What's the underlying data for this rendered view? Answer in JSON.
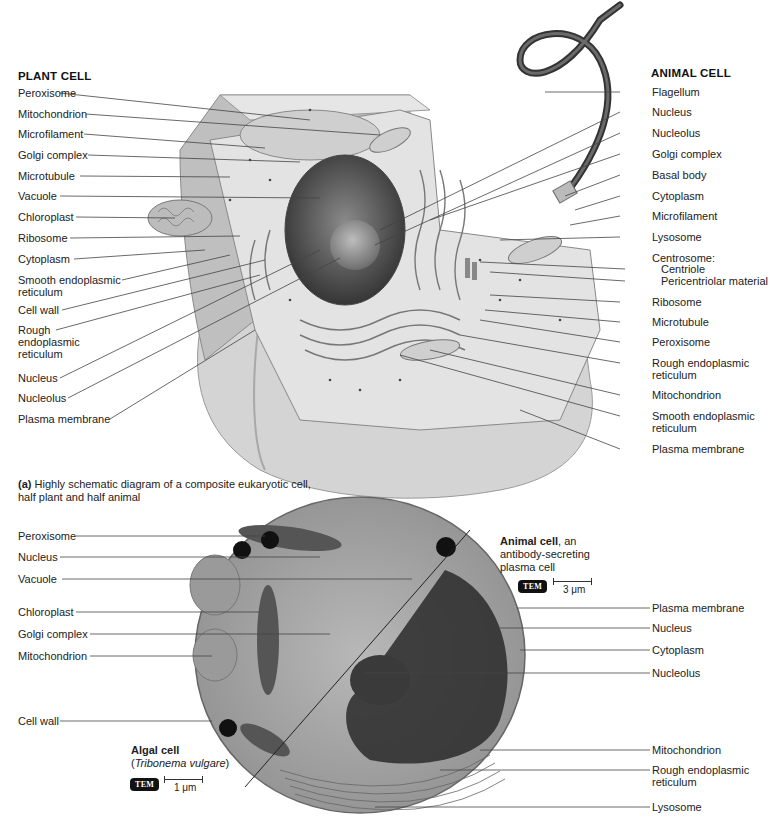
{
  "diagram_a": {
    "plant_header": "PLANT CELL",
    "animal_header": "ANIMAL CELL",
    "plant_labels": [
      "Peroxisome",
      "Mitochondrion",
      "Microfilament",
      "Golgi complex",
      "Microtubule",
      "Vacuole",
      "Chloroplast",
      "Ribosome",
      "Cytoplasm",
      "Smooth endoplasmic",
      "reticulum",
      "Cell wall",
      "Rough",
      "endoplasmic",
      "reticulum",
      "Nucleus",
      "Nucleolus",
      "Plasma membrane"
    ],
    "animal_labels": [
      "Flagellum",
      "Nucleus",
      "Nucleolus",
      "Golgi complex",
      "Basal body",
      "Cytoplasm",
      "Microfilament",
      "Lysosome",
      "Centrosome:",
      "Centriole",
      "Pericentriolar material",
      "Ribosome",
      "Microtubule",
      "Peroxisome",
      "Rough endoplasmic",
      "reticulum",
      "Mitochondrion",
      "Smooth endoplasmic",
      "reticulum",
      "Plasma membrane"
    ],
    "caption_prefix": "(a)",
    "caption_line1": " Highly schematic diagram of a composite eukaryotic cell,",
    "caption_line2": "half plant and half animal"
  },
  "micrograph": {
    "algal_labels": [
      "Peroxisome",
      "Nucleus",
      "Vacuole",
      "Chloroplast",
      "Golgi complex",
      "Mitochondrion",
      "Cell wall"
    ],
    "animal_labels": [
      "Plasma membrane",
      "Nucleus",
      "Cytoplasm",
      "Nucleolus",
      "Mitochondrion",
      "Rough endoplasmic",
      "reticulum",
      "Lysosome"
    ],
    "algal_title": "Algal cell",
    "algal_species_open": "(",
    "algal_species": "Tribonema vulgare",
    "algal_species_close": ")",
    "algal_badge": "TEM",
    "algal_scale": "1 μm",
    "animal_title": "Animal cell",
    "animal_title_suffix": ", an",
    "animal_desc1": "antibody-secreting",
    "animal_desc2": "plasma cell",
    "animal_badge": "TEM",
    "animal_scale": "3 μm"
  },
  "colors": {
    "text": "#222222",
    "leader": "#444444",
    "badge_bg": "#111111"
  }
}
